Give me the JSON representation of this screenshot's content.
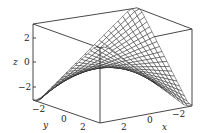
{
  "chart_data": {
    "type": "surface3d",
    "title": "",
    "function_hint": "saddle-like surface z = f(x, y) with peaks at opposite corners",
    "x": {
      "label": "x",
      "ticks": [
        2,
        0,
        -2
      ],
      "range": [
        -3,
        3
      ]
    },
    "y": {
      "label": "y",
      "ticks": [
        -2,
        0,
        2
      ],
      "range": [
        -3,
        3
      ]
    },
    "z": {
      "label": "z",
      "ticks": [
        2,
        0,
        -2
      ],
      "range": [
        -3,
        3
      ]
    },
    "style": {
      "mesh": true,
      "box": true,
      "grid": false,
      "line_color": "#1a1a1a"
    }
  },
  "labels": {
    "z_axis": "z",
    "y_axis": "y",
    "x_axis": "x",
    "z_tick_2": "2",
    "z_tick_0": "0",
    "z_tick_m2": "−2",
    "y_tick_m2": "−2",
    "y_tick_0": "0",
    "y_tick_2": "2",
    "x_tick_2": "2",
    "x_tick_0": "0",
    "x_tick_m2": "−2"
  }
}
